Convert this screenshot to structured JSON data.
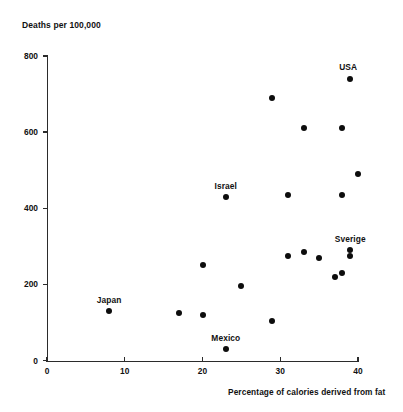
{
  "chart_data": {
    "type": "scatter",
    "title": "",
    "xlabel": "Percentage of calories derived from fat",
    "ylabel": "Deaths per 100,000",
    "xlim": [
      0,
      44
    ],
    "ylim": [
      0,
      810
    ],
    "xticks": [
      0,
      10,
      20,
      30,
      40
    ],
    "yticks": [
      0,
      200,
      400,
      600,
      800
    ],
    "grid": false,
    "legend": "none",
    "marker_color": "#0d0d0d",
    "axis_color": "#2b2b2b",
    "points": [
      {
        "label": "Japan",
        "x": 8,
        "y": 130,
        "label_dx": 0,
        "label_dy": -14
      },
      {
        "label": "",
        "x": 17,
        "y": 125,
        "label_dx": 0,
        "label_dy": 0
      },
      {
        "label": "",
        "x": 20,
        "y": 120,
        "label_dx": 0,
        "label_dy": 0
      },
      {
        "label": "",
        "x": 20,
        "y": 250,
        "label_dx": 0,
        "label_dy": 0
      },
      {
        "label": "Mexico",
        "x": 23,
        "y": 30,
        "label_dx": 0,
        "label_dy": -14
      },
      {
        "label": "Israel",
        "x": 23,
        "y": 430,
        "label_dx": 0,
        "label_dy": -14
      },
      {
        "label": "",
        "x": 25,
        "y": 195,
        "label_dx": 0,
        "label_dy": 0
      },
      {
        "label": "",
        "x": 29,
        "y": 105,
        "label_dx": 0,
        "label_dy": 0
      },
      {
        "label": "",
        "x": 29,
        "y": 690,
        "label_dx": 0,
        "label_dy": 0
      },
      {
        "label": "",
        "x": 31,
        "y": 435,
        "label_dx": 0,
        "label_dy": 0
      },
      {
        "label": "",
        "x": 31,
        "y": 275,
        "label_dx": 0,
        "label_dy": 0
      },
      {
        "label": "",
        "x": 33,
        "y": 610,
        "label_dx": 0,
        "label_dy": 0
      },
      {
        "label": "",
        "x": 33,
        "y": 285,
        "label_dx": 0,
        "label_dy": 0
      },
      {
        "label": "",
        "x": 35,
        "y": 270,
        "label_dx": 0,
        "label_dy": 0
      },
      {
        "label": "",
        "x": 37,
        "y": 220,
        "label_dx": 0,
        "label_dy": 0
      },
      {
        "label": "",
        "x": 38,
        "y": 610,
        "label_dx": 0,
        "label_dy": 0
      },
      {
        "label": "",
        "x": 38,
        "y": 435,
        "label_dx": 0,
        "label_dy": 0
      },
      {
        "label": "",
        "x": 38,
        "y": 230,
        "label_dx": 0,
        "label_dy": 0
      },
      {
        "label": "Sverige",
        "x": 39,
        "y": 290,
        "label_dx": 0,
        "label_dy": -14
      },
      {
        "label": "",
        "x": 39,
        "y": 275,
        "label_dx": 0,
        "label_dy": 0
      },
      {
        "label": "USA",
        "x": 39,
        "y": 740,
        "label_dx": -2,
        "label_dy": -15
      },
      {
        "label": "",
        "x": 40,
        "y": 490,
        "label_dx": 0,
        "label_dy": 0
      }
    ]
  },
  "axes": {
    "y_title": "Deaths per 100,000",
    "x_title": "Percentage of calories derived from fat",
    "y_tick_labels": [
      "0",
      "200",
      "400",
      "600",
      "800"
    ],
    "x_tick_labels": [
      "0",
      "10",
      "20",
      "30",
      "40"
    ]
  }
}
